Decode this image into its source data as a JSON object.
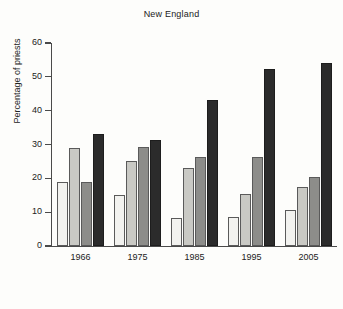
{
  "chart_data": {
    "type": "bar",
    "title": "New England",
    "xlabel": "",
    "ylabel": "Percentage of priests",
    "categories": [
      "1966",
      "1975",
      "1985",
      "1995",
      "2005"
    ],
    "series": [
      {
        "name": "series-1",
        "values": [
          19.0,
          15.0,
          8.3,
          8.5,
          10.5
        ],
        "color": "#f2f2ef"
      },
      {
        "name": "series-2",
        "values": [
          29.0,
          25.2,
          23.2,
          15.3,
          17.5
        ],
        "color": "#c9c9c4"
      },
      {
        "name": "series-3",
        "values": [
          19.0,
          29.2,
          26.2,
          26.3,
          20.3
        ],
        "color": "#8d8d8a"
      },
      {
        "name": "series-4",
        "values": [
          33.1,
          31.2,
          43.2,
          52.4,
          54.0
        ],
        "color": "#2b2b2b"
      }
    ],
    "ylim": [
      0,
      60
    ],
    "yticks": [
      0,
      10,
      20,
      30,
      40,
      50,
      60
    ],
    "ytick_labels": [
      "0",
      "10",
      "20",
      "30",
      "40",
      "50",
      "60"
    ],
    "grid": false,
    "legend": "none"
  }
}
